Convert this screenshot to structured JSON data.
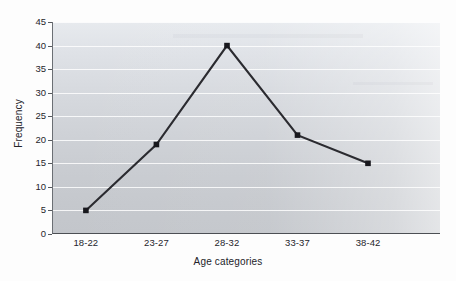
{
  "chart_data": {
    "type": "line",
    "title": "",
    "xlabel": "Age categories",
    "ylabel": "Frequency",
    "categories": [
      "18-22",
      "23-27",
      "28-32",
      "33-37",
      "38-42"
    ],
    "values": [
      5,
      19,
      40,
      21,
      15
    ],
    "series": [
      {
        "name": "Frequency",
        "values": [
          5,
          19,
          40,
          21,
          15
        ]
      }
    ],
    "ylim": [
      0,
      45
    ],
    "yticks": [
      "0",
      "5",
      "10",
      "15",
      "20",
      "25",
      "30",
      "35",
      "40",
      "45"
    ],
    "ytick_values": [
      0,
      5,
      10,
      15,
      20,
      25,
      30,
      35,
      40,
      45
    ],
    "grid": "horizontal",
    "legend": "none",
    "marker": "square",
    "line_color": "#2b2b30",
    "marker_color": "#1a1a1f",
    "plot_background": "#d3d6db",
    "gridline_color": "#ffffff",
    "axis_color": "#55585d"
  },
  "axes": {
    "y_title": "Frequency",
    "x_title": "Age categories"
  },
  "caption": {
    "text": ""
  }
}
